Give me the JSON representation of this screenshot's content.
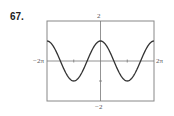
{
  "problem_number": "67.",
  "chart_data": {
    "type": "line",
    "title": "",
    "function": "y = cos(x)",
    "xlabel": "",
    "ylabel": "",
    "xlim": [
      -6.2832,
      6.2832
    ],
    "ylim": [
      -2,
      2
    ],
    "x_tick_labels": {
      "min": "−2π",
      "max": "2π"
    },
    "y_tick_labels": {
      "min": "−2",
      "max": "2"
    },
    "minor_ticks_x": [
      -3.1416,
      3.1416
    ],
    "minor_ticks_y": [
      -1,
      1
    ],
    "grid": false,
    "legend": null,
    "series": [
      {
        "name": "cos(x)",
        "x": [
          -6.2832,
          -4.7124,
          -3.1416,
          -1.5708,
          0,
          1.5708,
          3.1416,
          4.7124,
          6.2832
        ],
        "values": [
          1,
          0,
          -1,
          0,
          1,
          0,
          -1,
          0,
          1
        ]
      }
    ],
    "colors": {
      "curve": "#333333",
      "axes": "#777777",
      "frame": "#888888"
    }
  }
}
